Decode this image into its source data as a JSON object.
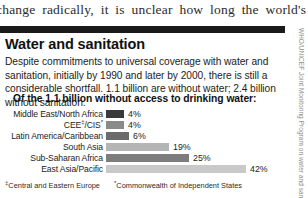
{
  "running_text": "change radically, it is unclear how long the world's",
  "box": {
    "title": "Water and sanitation",
    "body": "Despite commitments to universal coverage with water and sanitation, initially by 1990 and later by 2000, there is still a considerable shortfall. 1.1 billion are without water; 2.4 billion without sanitation.",
    "subhead": "Of the 1.1 billion without access to drinking water:"
  },
  "footnotes": {
    "marker1": "‡",
    "note1": "Central and Eastern Europe",
    "marker2": "*",
    "note2": "Commonwealth of Independent States"
  },
  "credit": "WHO/UNICEF Joint Monitoring Program on water and sanitation",
  "chart_data": {
    "type": "bar",
    "title": "Of the 1.1 billion without access to drinking water:",
    "xlabel": "",
    "ylabel": "",
    "orientation": "horizontal",
    "xlim": [
      0,
      42
    ],
    "grid": false,
    "legend": "none",
    "value_suffix": "%",
    "categories": [
      "Middle East/North Africa",
      "CEE‡/CIS*",
      "Latin America/Caribbean",
      "South Asia",
      "Sub-Saharan Africa",
      "East Asia/Pacific"
    ],
    "values": [
      4,
      4,
      6,
      19,
      25,
      42
    ],
    "value_labels": [
      "4%",
      "4%",
      "6%",
      "19%",
      "25%",
      "42%"
    ],
    "bar_colors": [
      "#3a3a3a",
      "#8a8a8a",
      "#6b6b6b",
      "#b5b5b5",
      "#7d7d7d",
      "#c9c9c9"
    ],
    "px_per_unit": 3.33,
    "bar_origin_px": 106,
    "rows": [
      {
        "label_html": "Middle East/North Africa",
        "value": 4,
        "label": "4%",
        "color": "#3a3a3a",
        "width_px": 18
      },
      {
        "label_html": "CEE<sup>‡</sup>/CIS<sup>*</sup>",
        "value": 4,
        "label": "4%",
        "color": "#8a8a8a",
        "width_px": 18
      },
      {
        "label_html": "Latin America/Caribbean",
        "value": 6,
        "label": "6%",
        "color": "#6b6b6b",
        "width_px": 23
      },
      {
        "label_html": "South Asia",
        "value": 19,
        "label": "19%",
        "color": "#b5b5b5",
        "width_px": 63
      },
      {
        "label_html": "Sub-Saharan Africa",
        "value": 25,
        "label": "25%",
        "color": "#7d7d7d",
        "width_px": 83
      },
      {
        "label_html": "East Asia/Pacific",
        "value": 42,
        "label": "42%",
        "color": "#c9c9c9",
        "width_px": 140
      }
    ]
  },
  "colors": {
    "rule": "#1a1a1a",
    "text": "#1c1c1c",
    "credit": "#8d8d8d",
    "page_bg": "#ffffff"
  }
}
